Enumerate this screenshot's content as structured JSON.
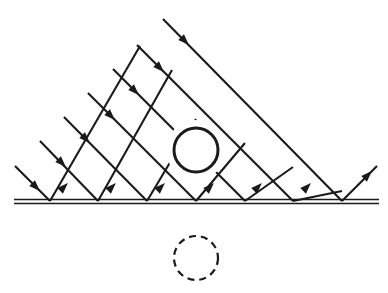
{
  "figure": {
    "domain": "diagram",
    "width": 388,
    "height": 293,
    "background_color": "#ffffff",
    "ink_color": "#1a1a1a"
  },
  "style": {
    "ray_stroke_width": 2.1,
    "mirror_stroke_width": 1.6,
    "object_stroke_width": 3.0,
    "image_stroke_width": 2.2,
    "image_dash_pattern": "7 5",
    "arrow_length": 11,
    "arrow_half_width": 4.0
  },
  "mirror": {
    "name": "plane-mirror",
    "label": "mirror surface",
    "x_start": 14,
    "x_end": 379,
    "y_top": 199.5,
    "y_bottom": 203.5,
    "line_count": 2
  },
  "lattice": {
    "name": "ray-lattice",
    "apex_x": 196,
    "apex_y": 10,
    "baseline_y": 201,
    "spacing": 47.8,
    "reflection_points": [
      {
        "x": 50,
        "y": 201
      },
      {
        "x": 98,
        "y": 201
      },
      {
        "x": 147,
        "y": 201
      },
      {
        "x": 196,
        "y": 201
      },
      {
        "x": 245,
        "y": 201
      },
      {
        "x": 293,
        "y": 201
      },
      {
        "x": 342,
        "y": 201
      }
    ],
    "incoming_entry_points": [
      {
        "x": 15,
        "y": 166
      },
      {
        "x": 40,
        "y": 141
      },
      {
        "x": 64,
        "y": 117
      },
      {
        "x": 88,
        "y": 93
      },
      {
        "x": 113,
        "y": 69
      },
      {
        "x": 137,
        "y": 45
      },
      {
        "x": 163,
        "y": 19
      }
    ],
    "outgoing_exit_point": {
      "x": 377,
      "y": 166
    }
  },
  "rays": {
    "name": "ray-family",
    "incident_direction": "down-right at 45 degrees",
    "reflected_direction": "up-right at 45 degrees",
    "incident_segments": [
      {
        "x1": 15,
        "y1": 166,
        "x2": 50,
        "y2": 201
      },
      {
        "x1": 40,
        "y1": 141,
        "x2": 98,
        "y2": 201
      },
      {
        "x1": 64,
        "y1": 117,
        "x2": 147,
        "y2": 201
      },
      {
        "x1": 88,
        "y1": 93,
        "x2": 196,
        "y2": 201
      },
      {
        "x1": 113,
        "y1": 69,
        "x2": 245,
        "y2": 201
      },
      {
        "x1": 137,
        "y1": 45,
        "x2": 293,
        "y2": 201
      },
      {
        "x1": 163,
        "y1": 19,
        "x2": 342,
        "y2": 201
      }
    ],
    "reflected_segments": [
      {
        "x1": 50,
        "y1": 201,
        "x2": 140,
        "y2": 46
      },
      {
        "x1": 98,
        "y1": 201,
        "x2": 172,
        "y2": 70
      },
      {
        "x1": 147,
        "y1": 201,
        "x2": 196,
        "y2": 119
      },
      {
        "x1": 196,
        "y1": 201,
        "x2": 245,
        "y2": 143
      },
      {
        "x1": 245,
        "y1": 201,
        "x2": 293,
        "y2": 167
      },
      {
        "x1": 293,
        "y1": 201,
        "x2": 342,
        "y2": 191
      },
      {
        "x1": 342,
        "y1": 201,
        "x2": 377,
        "y2": 166
      }
    ],
    "arrow_markers_incident": [
      {
        "x": 36,
        "y": 187,
        "dir": "down-right"
      },
      {
        "x": 62,
        "y": 163,
        "dir": "down-right"
      },
      {
        "x": 86,
        "y": 139,
        "dir": "down-right"
      },
      {
        "x": 111,
        "y": 116,
        "dir": "down-right"
      },
      {
        "x": 135,
        "y": 91,
        "dir": "down-right"
      },
      {
        "x": 160,
        "y": 68,
        "dir": "down-right"
      },
      {
        "x": 185,
        "y": 41,
        "dir": "down-right"
      }
    ],
    "arrow_markers_reflected": [
      {
        "x": 64,
        "y": 187,
        "dir": "up-right"
      },
      {
        "x": 112,
        "y": 187,
        "dir": "up-right"
      },
      {
        "x": 161,
        "y": 187,
        "dir": "up-right"
      },
      {
        "x": 210,
        "y": 187,
        "dir": "up-right"
      },
      {
        "x": 258,
        "y": 187,
        "dir": "up-right"
      },
      {
        "x": 307,
        "y": 187,
        "dir": "up-right"
      },
      {
        "x": 368,
        "y": 175,
        "dir": "up-right"
      }
    ]
  },
  "object": {
    "name": "object-circle",
    "label": "real object",
    "cx": 196,
    "cy": 150,
    "r": 22,
    "line_style": "solid",
    "occlusion_radius": 30
  },
  "image": {
    "name": "virtual-image-circle",
    "label": "virtual image",
    "cx": 196,
    "cy": 258,
    "r": 22,
    "line_style": "dashed"
  }
}
